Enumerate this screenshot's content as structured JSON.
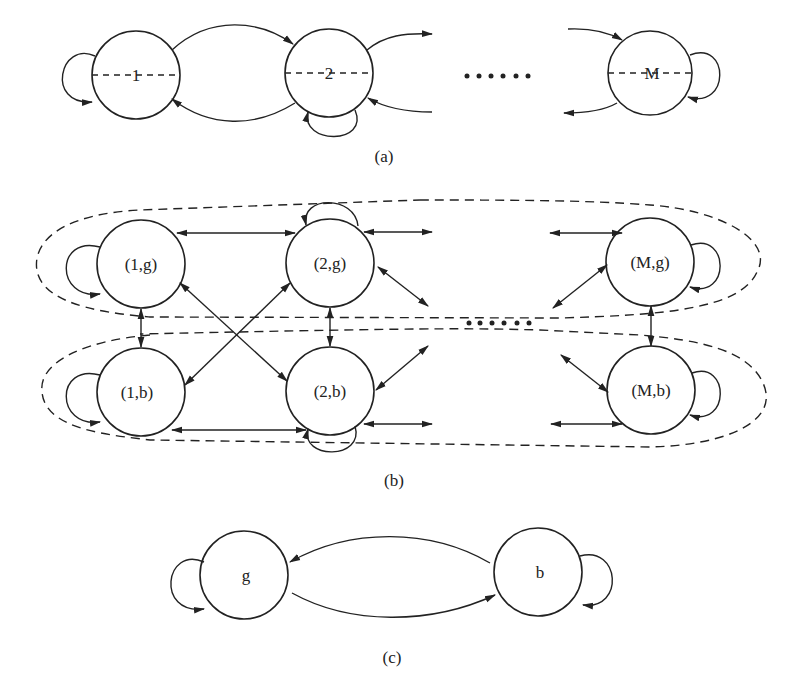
{
  "figure": {
    "panel_a": {
      "caption": "(a)",
      "nodes": [
        {
          "id": "1",
          "label": "1",
          "cx": 136,
          "cy": 75,
          "r": 44
        },
        {
          "id": "2",
          "label": "2",
          "cx": 329,
          "cy": 73,
          "r": 44
        },
        {
          "id": "M",
          "label": "M",
          "cx": 650,
          "cy": 73,
          "r": 42
        }
      ],
      "ellipsis": "……"
    },
    "panel_b": {
      "caption": "(b)",
      "nodes": [
        {
          "id": "1g",
          "label": "(1,g)",
          "cx": 141,
          "cy": 264,
          "r": 44
        },
        {
          "id": "2g",
          "label": "(2,g)",
          "cx": 330,
          "cy": 263,
          "r": 44
        },
        {
          "id": "Mg",
          "label": "(M,g)",
          "cx": 650,
          "cy": 262,
          "r": 44
        },
        {
          "id": "1b",
          "label": "(1,b)",
          "cx": 141,
          "cy": 392,
          "r": 44
        },
        {
          "id": "2b",
          "label": "(2,b)",
          "cx": 330,
          "cy": 391,
          "r": 44
        },
        {
          "id": "Mb",
          "label": "(M,b)",
          "cx": 651,
          "cy": 390,
          "r": 44
        }
      ],
      "groups": [
        "good-state group",
        "bad-state group"
      ]
    },
    "panel_c": {
      "caption": "(c)",
      "nodes": [
        {
          "id": "g",
          "label": "g",
          "cx": 244,
          "cy": 575,
          "r": 44
        },
        {
          "id": "b",
          "label": "b",
          "cx": 538,
          "cy": 572,
          "r": 44
        }
      ]
    }
  }
}
